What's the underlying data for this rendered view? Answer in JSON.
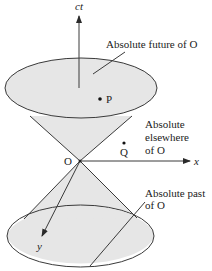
{
  "axes": {
    "time": "ct",
    "x": "x",
    "y": "y"
  },
  "origin": "O",
  "points": [
    {
      "label": "P"
    },
    {
      "label": "Q"
    }
  ],
  "regions": {
    "future": "Absolute future of O",
    "elsewhere_line1": "Absolute",
    "elsewhere_line2": "elsewhere",
    "elsewhere_line3": "of O",
    "past_line1": "Absolute past",
    "past_line2": "of O"
  },
  "colors": {
    "cone_fill": "#e6e6e6",
    "stroke": "#3a3a3a",
    "background": "#ffffff"
  }
}
